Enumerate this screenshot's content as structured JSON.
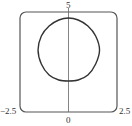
{
  "chart_data": {
    "type": "line",
    "title": "",
    "xlabel": "",
    "ylabel": "",
    "xlim": [
      -2.5,
      2.5
    ],
    "ylim": [
      0,
      5
    ],
    "grid": false,
    "legend": null,
    "tick_labels": {
      "x_left": "−2.5",
      "x_center": "0",
      "x_right": "2.5",
      "y_top": "5"
    },
    "series": [
      {
        "name": "closed curve",
        "description": "Rounded-square closed curve centered near (0, 3.1)",
        "points": [
          [
            0.0,
            4.7
          ],
          [
            0.5,
            4.6
          ],
          [
            1.0,
            4.3
          ],
          [
            1.4,
            3.8
          ],
          [
            1.6,
            3.1
          ],
          [
            1.4,
            2.4
          ],
          [
            1.0,
            1.85
          ],
          [
            0.5,
            1.6
          ],
          [
            0.0,
            1.55
          ],
          [
            -0.5,
            1.6
          ],
          [
            -1.0,
            1.85
          ],
          [
            -1.4,
            2.4
          ],
          [
            -1.57,
            3.1
          ],
          [
            -1.4,
            3.8
          ],
          [
            -1.0,
            4.3
          ],
          [
            -0.5,
            4.6
          ],
          [
            0.0,
            4.7
          ]
        ]
      }
    ],
    "annotations": [
      "vertical axis line at x = 0"
    ]
  },
  "colors": {
    "frame": "#555555",
    "curve": "#333333",
    "axis": "#666666",
    "text": "#333333"
  }
}
